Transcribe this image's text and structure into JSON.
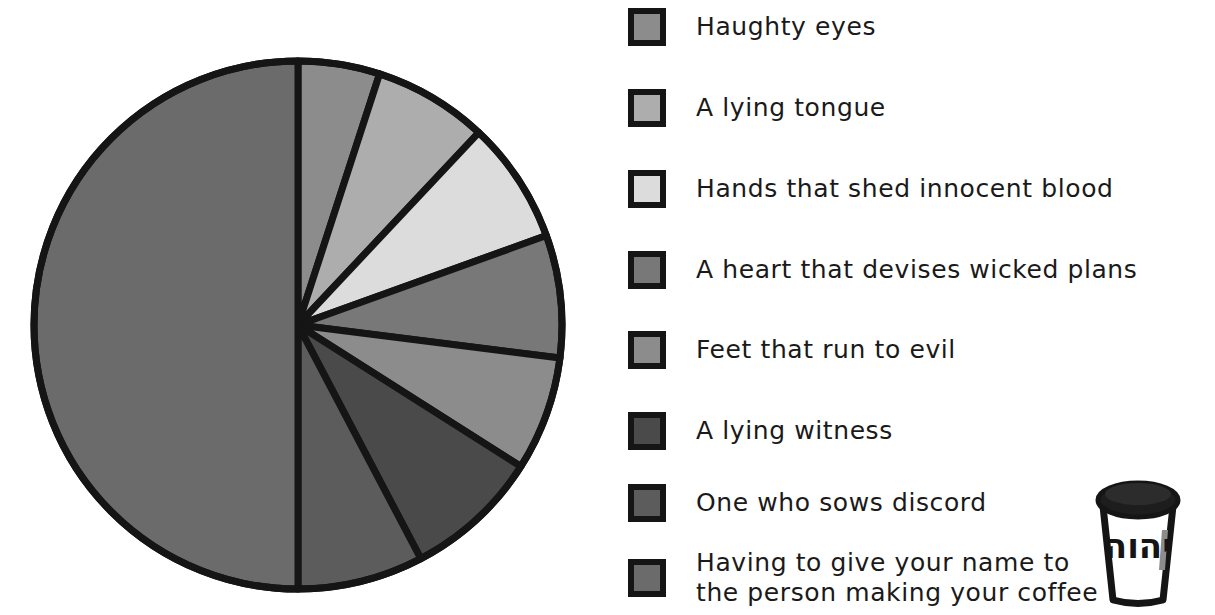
{
  "chart_data": {
    "type": "pie",
    "title": "",
    "subtitle": "",
    "legend_position": "right",
    "start_angle_deg": 0,
    "direction": "clockwise",
    "categories": [
      "Haughty eyes",
      "A lying tongue",
      "Hands that shed innocent blood",
      "A heart that devises wicked plans",
      "Feet that run to evil",
      "A lying witness",
      "One who sows discord",
      "Having to give your name to\nthe person making your coffee"
    ],
    "values": [
      5.0,
      7.0,
      7.5,
      7.5,
      7.0,
      8.3,
      7.7,
      50.0
    ],
    "angles_deg": [
      18,
      25,
      27,
      27,
      25,
      30,
      28,
      180
    ],
    "colors": [
      "#8c8c8c",
      "#adadad",
      "#dcdcdc",
      "#787878",
      "#8c8c8c",
      "#4a4a4a",
      "#5c5c5c",
      "#6b6b6b"
    ],
    "slice_border_color": "#151515",
    "grid": false
  },
  "legend": {
    "items": [
      {
        "label": "Haughty eyes",
        "color": "#8c8c8c"
      },
      {
        "label": "A lying tongue",
        "color": "#adadad"
      },
      {
        "label": "Hands that shed innocent blood",
        "color": "#dcdcdc"
      },
      {
        "label": "A heart that devises wicked plans",
        "color": "#787878"
      },
      {
        "label": "Feet that run to evil",
        "color": "#8c8c8c"
      },
      {
        "label": "A lying witness",
        "color": "#4a4a4a"
      },
      {
        "label": "One who sows discord",
        "color": "#5c5c5c"
      },
      {
        "label": "Having to give your name to\nthe person making your coffee",
        "color": "#6b6b6b"
      }
    ]
  },
  "decoration": {
    "coffee_cup_text": "יהוה"
  },
  "palette": {
    "ink": "#151515",
    "background": "#ffffff"
  }
}
